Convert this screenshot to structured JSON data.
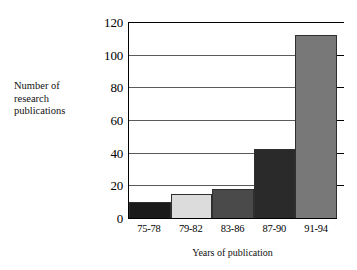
{
  "chart_data": {
    "type": "bar",
    "title": "",
    "xlabel": "Years of publication",
    "ylabel": "Number of\nresearch\npublications",
    "categories": [
      "75-78",
      "79-82",
      "83-86",
      "87-90",
      "91-94"
    ],
    "values": [
      10,
      15,
      18,
      42,
      112
    ],
    "bar_colors": [
      "#1a1a1a",
      "#dcdcdc",
      "#4a4a4a",
      "#2a2a2a",
      "#787878"
    ],
    "ylim": [
      0,
      120
    ],
    "yticks": [
      0,
      20,
      40,
      60,
      80,
      100,
      120
    ],
    "ytick_labels": [
      "0",
      "20",
      "40",
      "60",
      "80",
      "100",
      "120"
    ],
    "grid": true,
    "grid_axis": "y",
    "legend": "none",
    "background_color": "#ffffff",
    "axis_color": "#000000",
    "gridline_color": "#5a5a5a"
  }
}
